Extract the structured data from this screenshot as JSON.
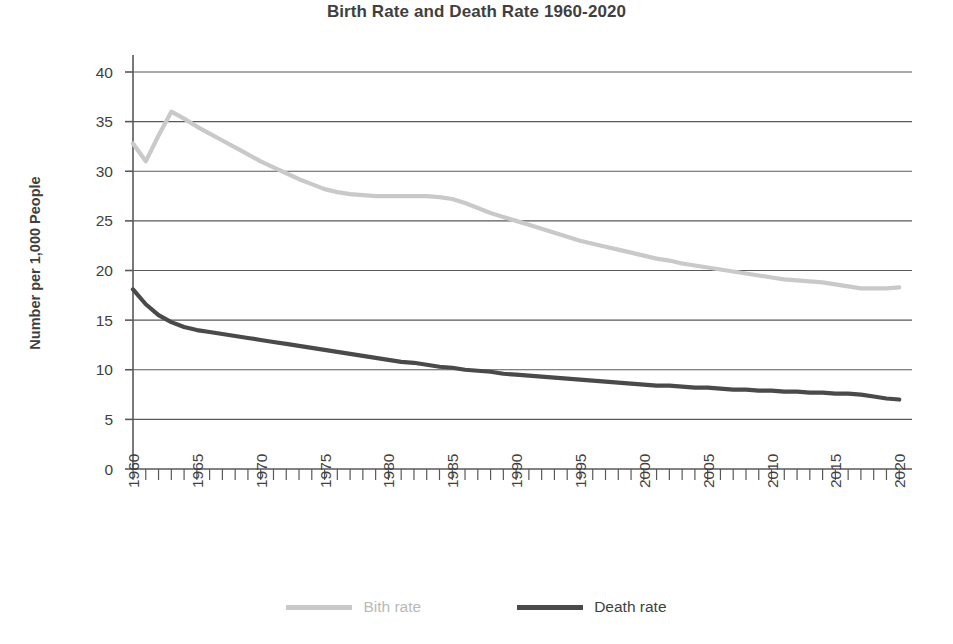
{
  "chart_data": {
    "type": "line",
    "title": "Birth Rate and Death Rate 1960-2020",
    "xlabel": "",
    "ylabel": "Number per 1,000 People",
    "xlim": [
      1960,
      2021
    ],
    "ylim": [
      0,
      40
    ],
    "y_ticks": [
      0,
      5,
      10,
      15,
      20,
      25,
      30,
      35,
      40
    ],
    "y_tick_labels": [
      "0",
      "5",
      "10",
      "15",
      "20",
      "25",
      "30",
      "35",
      "40"
    ],
    "x_ticks": [
      1960,
      1965,
      1970,
      1975,
      1980,
      1985,
      1990,
      1995,
      2000,
      2005,
      2010,
      2015,
      2020
    ],
    "x_tick_labels": [
      "1960",
      "1965",
      "1970",
      "1975",
      "1980",
      "1985",
      "1990",
      "1995",
      "2000",
      "2005",
      "2010",
      "2015",
      "2020"
    ],
    "x_minor_tick_step": 1,
    "grid": "horizontal",
    "legend_position": "bottom",
    "series": [
      {
        "name": "Bith rate",
        "color": "#c9c9c9",
        "x": [
          1960,
          1961,
          1962,
          1963,
          1964,
          1965,
          1966,
          1967,
          1968,
          1969,
          1970,
          1971,
          1972,
          1973,
          1974,
          1975,
          1976,
          1977,
          1978,
          1979,
          1980,
          1981,
          1982,
          1983,
          1984,
          1985,
          1986,
          1987,
          1988,
          1989,
          1990,
          1991,
          1992,
          1993,
          1994,
          1995,
          1996,
          1997,
          1998,
          1999,
          2000,
          2001,
          2002,
          2003,
          2004,
          2005,
          2006,
          2007,
          2008,
          2009,
          2010,
          2011,
          2012,
          2013,
          2014,
          2015,
          2016,
          2017,
          2018,
          2019,
          2020
        ],
        "values": [
          32.8,
          31.0,
          33.6,
          36.0,
          35.3,
          34.5,
          33.8,
          33.1,
          32.4,
          31.7,
          31.0,
          30.4,
          29.8,
          29.2,
          28.7,
          28.2,
          27.9,
          27.7,
          27.6,
          27.5,
          27.5,
          27.5,
          27.5,
          27.5,
          27.4,
          27.2,
          26.8,
          26.3,
          25.8,
          25.4,
          25.0,
          24.6,
          24.2,
          23.8,
          23.4,
          23.0,
          22.7,
          22.4,
          22.1,
          21.8,
          21.5,
          21.2,
          21.0,
          20.7,
          20.5,
          20.3,
          20.1,
          19.9,
          19.7,
          19.5,
          19.3,
          19.1,
          19.0,
          18.9,
          18.8,
          18.6,
          18.4,
          18.2,
          18.2,
          18.2,
          18.3
        ]
      },
      {
        "name": "Death rate",
        "color": "#4a4a4a",
        "x": [
          1960,
          1961,
          1962,
          1963,
          1964,
          1965,
          1966,
          1967,
          1968,
          1969,
          1970,
          1971,
          1972,
          1973,
          1974,
          1975,
          1976,
          1977,
          1978,
          1979,
          1980,
          1981,
          1982,
          1983,
          1984,
          1985,
          1986,
          1987,
          1988,
          1989,
          1990,
          1991,
          1992,
          1993,
          1994,
          1995,
          1996,
          1997,
          1998,
          1999,
          2000,
          2001,
          2002,
          2003,
          2004,
          2005,
          2006,
          2007,
          2008,
          2009,
          2010,
          2011,
          2012,
          2013,
          2014,
          2015,
          2016,
          2017,
          2018,
          2019,
          2020
        ],
        "values": [
          18.1,
          16.6,
          15.5,
          14.8,
          14.3,
          14.0,
          13.8,
          13.6,
          13.4,
          13.2,
          13.0,
          12.8,
          12.6,
          12.4,
          12.2,
          12.0,
          11.8,
          11.6,
          11.4,
          11.2,
          11.0,
          10.8,
          10.7,
          10.5,
          10.3,
          10.2,
          10.0,
          9.9,
          9.8,
          9.6,
          9.5,
          9.4,
          9.3,
          9.2,
          9.1,
          9.0,
          8.9,
          8.8,
          8.7,
          8.6,
          8.5,
          8.4,
          8.4,
          8.3,
          8.2,
          8.2,
          8.1,
          8.0,
          8.0,
          7.9,
          7.9,
          7.8,
          7.8,
          7.7,
          7.7,
          7.6,
          7.6,
          7.5,
          7.3,
          7.1,
          7.0
        ]
      }
    ]
  },
  "legend": {
    "items": [
      {
        "label": "Bith rate"
      },
      {
        "label": "Death rate"
      }
    ]
  },
  "colors": {
    "birth_line": "#c9c9c9",
    "death_line": "#4a4a4a",
    "gridline": "#595959",
    "axis": "#595959",
    "text": "#3f3f3f"
  }
}
